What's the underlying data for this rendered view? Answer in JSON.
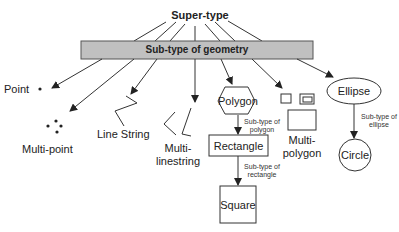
{
  "supertype": "Super-type",
  "subtype_bar": "Sub-type of geometry",
  "nodes": {
    "point": "Point",
    "multipoint": "Multi-point",
    "linestring": "Line String",
    "multilinestring_1": "Multi-",
    "multilinestring_2": "linestring",
    "polygon": "Polygon",
    "multipolygon_1": "Multi-",
    "multipolygon_2": "polygon",
    "ellipse": "Ellipse",
    "rectangle": "Rectangle",
    "square": "Square",
    "circle": "Circle"
  },
  "edge_labels": {
    "polygon_1": "Sub-type of",
    "polygon_2": "polygon",
    "rectangle_1": "Sub-type of",
    "rectangle_2": "rectangle",
    "ellipse_1": "Sub-type of",
    "ellipse_2": "ellipse"
  },
  "colors": {
    "bar_fill": "#c0c0c0",
    "line": "#333333"
  }
}
